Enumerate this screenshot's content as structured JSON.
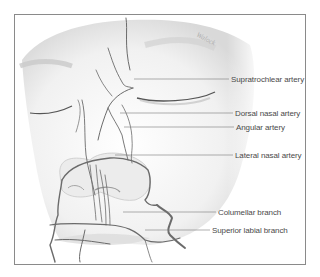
{
  "figure": {
    "frame_color": "#8a8a8a",
    "artery_color": "#6b6b6b",
    "label_color": "#4a4a4a",
    "signature": "Walock",
    "labels": [
      {
        "text": "Supratrochlear artery",
        "x": 231,
        "y": 75,
        "line_from": 134
      },
      {
        "text": "Dorsal nasal artery",
        "x": 235,
        "y": 109,
        "line_from": 120
      },
      {
        "text": "Angular artery",
        "x": 236,
        "y": 123,
        "line_from": 124
      },
      {
        "text": "Lateral nasal artery",
        "x": 235,
        "y": 151,
        "line_from": 115
      },
      {
        "text": "Columellar branch",
        "x": 218,
        "y": 208,
        "line_from": 123
      },
      {
        "text": "Superior labial branch",
        "x": 212,
        "y": 226,
        "line_from": 145
      }
    ]
  }
}
